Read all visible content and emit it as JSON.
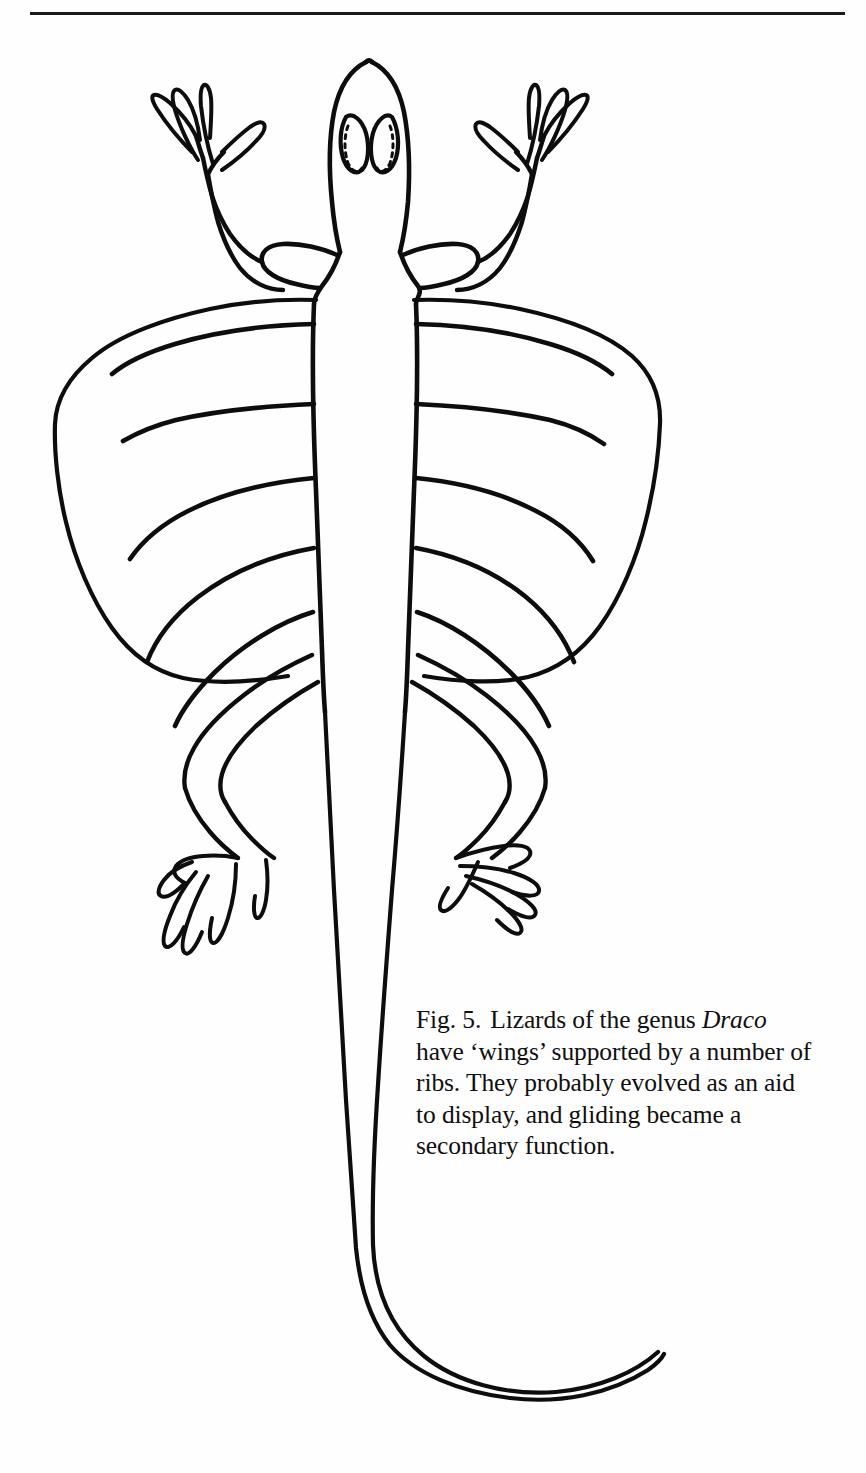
{
  "page": {
    "background_color": "#ffffff",
    "ink_color": "#000000"
  },
  "rule": {
    "name": "horizontal-rule",
    "color": "#1a1a1a"
  },
  "figure": {
    "label": "Fig. 5.",
    "caption_parts": {
      "before_genus": "Lizards of the genus",
      "genus": "Draco",
      "after_genus": "have ‘wings’ supported by a number of ribs. They probably evolved as an aid to display, and gliding became a secondary function."
    },
    "caption_full": "Fig. 5.  Lizards of the genus Draco have ‘wings’ supported by a number of ribs. They probably evolved as an aid to display, and gliding became a secondary function.",
    "parts": {
      "head": "head",
      "left_eye": "left-eye",
      "right_eye": "right-eye",
      "body": "body-trunk",
      "tail": "tail",
      "left_forelimb": "left-forelimb",
      "right_forelimb": "right-forelimb",
      "left_hindlimb": "left-hindlimb",
      "right_hindlimb": "right-hindlimb",
      "left_wing": "left-patagium",
      "right_wing": "right-patagium",
      "rib_count_per_wing": 5
    }
  }
}
